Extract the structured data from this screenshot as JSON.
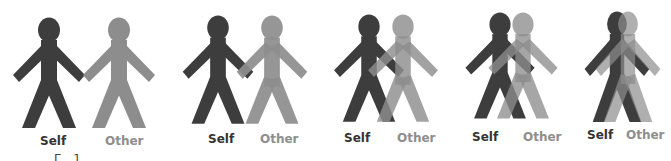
{
  "colors": {
    "self": "#3d3d3d",
    "other": "#8d8d8d",
    "self_label": "#333333",
    "other_label": "#8e8e8e"
  },
  "pairs": [
    {
      "stage": 1,
      "self_label": "Self",
      "other_label": "Other",
      "self_x": 49,
      "other_x": 119,
      "scale": 1.0
    },
    {
      "stage": 2,
      "self_label": "Self",
      "other_label": "Other",
      "self_x": 218,
      "other_x": 272,
      "scale": 0.98
    },
    {
      "stage": 3,
      "self_label": "Self",
      "other_label": "Other",
      "self_x": 369,
      "other_x": 403,
      "scale": 0.97
    },
    {
      "stage": 4,
      "self_label": "Self",
      "other_label": "Other",
      "self_x": 500,
      "other_x": 523,
      "scale": 0.96
    },
    {
      "stage": 5,
      "self_label": "Self",
      "other_label": "Other",
      "self_x": 617,
      "other_x": 628,
      "scale": 0.86
    }
  ],
  "caption_fragment": "Г 1"
}
